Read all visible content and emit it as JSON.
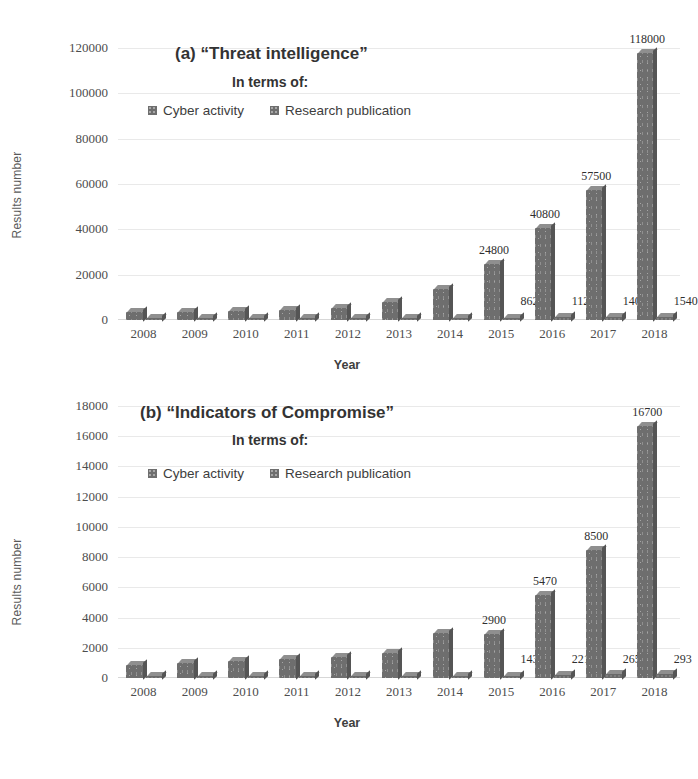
{
  "figure": {
    "background": "#ffffff",
    "bar_color": "#6e6e6e",
    "grid_color": "#e9e9e9"
  },
  "charts": [
    {
      "id": "chart-a",
      "title": "(a) “Threat intelligence”",
      "subtitle": "In terms of:",
      "legend": [
        {
          "label": "Cyber activity",
          "color": "#6e6e6e"
        },
        {
          "label": "Research publication",
          "color": "#6e6e6e"
        }
      ]
    },
    {
      "id": "chart-b",
      "title": "(b) “Indicators of Compromise”",
      "subtitle": "In terms of:",
      "legend": [
        {
          "label": "Cyber activity",
          "color": "#6e6e6e"
        },
        {
          "label": "Research publication",
          "color": "#6e6e6e"
        }
      ]
    }
  ],
  "chart_data": [
    {
      "type": "bar",
      "id": "a",
      "title": "(a) “Threat intelligence”",
      "subtitle": "In terms of:",
      "xlabel": "Year",
      "ylabel": "Results number",
      "ylim": [
        0,
        120000
      ],
      "yticks": [
        0,
        20000,
        40000,
        60000,
        80000,
        100000,
        120000
      ],
      "ytick_labels": [
        "0",
        "20000",
        "40000",
        "60000",
        "80000",
        "100000",
        "120000"
      ],
      "grid": true,
      "legend_position": "top-center",
      "categories": [
        "2008",
        "2009",
        "2010",
        "2011",
        "2012",
        "2013",
        "2014",
        "2015",
        "2016",
        "2017",
        "2018"
      ],
      "series": [
        {
          "name": "Cyber activity",
          "values": [
            3400,
            3600,
            3900,
            4600,
            5400,
            7900,
            13600,
            24800,
            40800,
            57500,
            118000
          ],
          "labels": [
            "",
            "",
            "",
            "",
            "",
            "",
            "",
            "24800",
            "40800",
            "57500",
            "118000"
          ]
        },
        {
          "name": "Research publication",
          "values": [
            110,
            150,
            200,
            260,
            330,
            430,
            610,
            862,
            1120,
            1400,
            1540
          ],
          "labels": [
            "",
            "",
            "",
            "",
            "",
            "",
            "",
            "862",
            "1120",
            "1400",
            "1540"
          ]
        }
      ]
    },
    {
      "type": "bar",
      "id": "b",
      "title": "(b) “Indicators of Compromise”",
      "subtitle": "In terms of:",
      "xlabel": "Year",
      "ylabel": "Results number",
      "ylim": [
        0,
        18000
      ],
      "yticks": [
        0,
        2000,
        4000,
        6000,
        8000,
        10000,
        12000,
        14000,
        16000,
        18000
      ],
      "ytick_labels": [
        "0",
        "2000",
        "4000",
        "6000",
        "8000",
        "10000",
        "12000",
        "14000",
        "16000",
        "18000"
      ],
      "grid": true,
      "legend_position": "top-center",
      "categories": [
        "2008",
        "2009",
        "2010",
        "2011",
        "2012",
        "2013",
        "2014",
        "2015",
        "2016",
        "2017",
        "2018"
      ],
      "series": [
        {
          "name": "Cyber activity",
          "values": [
            880,
            980,
            1130,
            1240,
            1420,
            1680,
            2950,
            2900,
            5470,
            8500,
            16700
          ],
          "labels": [
            "",
            "",
            "",
            "",
            "",
            "",
            "",
            "2900",
            "5470",
            "8500",
            "16700"
          ]
        },
        {
          "name": "Research publication",
          "values": [
            40,
            52,
            66,
            80,
            96,
            112,
            128,
            143,
            221,
            265,
            293
          ],
          "labels": [
            "",
            "",
            "",
            "",
            "",
            "",
            "",
            "143",
            "221",
            "265",
            "293"
          ]
        }
      ]
    }
  ]
}
